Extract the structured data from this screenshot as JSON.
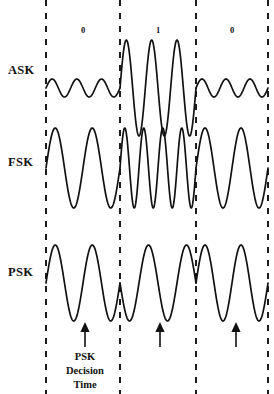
{
  "figure": {
    "background_color": "#ffffff",
    "stroke_color": "#111111",
    "width": 274,
    "height": 394
  },
  "bit_sequence": {
    "labels": [
      "0",
      "1",
      "0"
    ],
    "label_y": 33,
    "positions_x": [
      83,
      158,
      232
    ]
  },
  "dividers": {
    "x_positions": [
      46,
      120,
      196,
      268
    ],
    "y_top": 0,
    "y_bottom": 394,
    "style": "dashed"
  },
  "rows": [
    {
      "label": "ASK",
      "label_x": 8,
      "label_y": 74,
      "baseline_y": 88,
      "segments": [
        {
          "bit": "0",
          "cycles": 3,
          "amplitude": 9
        },
        {
          "bit": "1",
          "cycles": 3,
          "amplitude": 48
        },
        {
          "bit": "0",
          "cycles": 3,
          "amplitude": 9
        }
      ]
    },
    {
      "label": "FSK",
      "label_x": 8,
      "label_y": 166,
      "baseline_y": 168,
      "segments": [
        {
          "bit": "0",
          "cycles": 2,
          "amplitude": 40
        },
        {
          "bit": "1",
          "cycles": 4,
          "amplitude": 40
        },
        {
          "bit": "0",
          "cycles": 2,
          "amplitude": 40
        }
      ]
    },
    {
      "label": "PSK",
      "label_x": 8,
      "label_y": 276,
      "baseline_y": 283,
      "segments": [
        {
          "bit": "0",
          "cycles": 2,
          "amplitude": 38,
          "phase": 0
        },
        {
          "bit": "1",
          "cycles": 2,
          "amplitude": 38,
          "phase": 180
        },
        {
          "bit": "0",
          "cycles": 2,
          "amplitude": 38,
          "phase": 0
        }
      ]
    }
  ],
  "arrows": {
    "x_positions": [
      85,
      160,
      236
    ],
    "tip_y": 322,
    "tail_y": 347,
    "count": 3
  },
  "caption": {
    "lines": [
      "PSK",
      "Decision",
      "Time"
    ],
    "x": 85,
    "line_y": [
      360,
      374,
      388
    ]
  },
  "chart_data": {
    "type": "line",
    "xlabel": "",
    "ylabel": "",
    "x": [
      "bit 0",
      "bit 1",
      "bit 0"
    ],
    "categories": [
      "0",
      "1",
      "0"
    ],
    "series": [
      {
        "name": "ASK",
        "description": "Amplitude Shift Keying: constant frequency, amplitude low for bit 0 and high for bit 1",
        "values": [
          9,
          48,
          9
        ],
        "cycles_per_bit": [
          3,
          3,
          3
        ]
      },
      {
        "name": "FSK",
        "description": "Frequency Shift Keying: constant amplitude, low frequency for bit 0 and high frequency for bit 1",
        "values": [
          40,
          40,
          40
        ],
        "cycles_per_bit": [
          2,
          4,
          2
        ]
      },
      {
        "name": "PSK",
        "description": "Phase Shift Keying: constant amplitude and frequency, phase inverted 180 degrees on bit 1",
        "values": [
          38,
          38,
          38
        ],
        "cycles_per_bit": [
          2,
          2,
          2
        ],
        "phase_per_bit": [
          0,
          180,
          0
        ]
      }
    ],
    "annotations": [
      "PSK Decision Time"
    ],
    "grid": false,
    "legend": "left row labels"
  }
}
